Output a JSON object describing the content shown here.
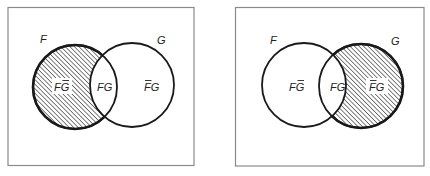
{
  "diagrams": [
    {
      "id": "left",
      "description": "Venn diagram with region F minus G (F and not G) shaded",
      "sets": {
        "F": {
          "label": "F"
        },
        "G": {
          "label": "G"
        }
      },
      "regions": {
        "f_only": {
          "label": "FG",
          "overbar": "G",
          "shaded": true
        },
        "both": {
          "label": "FG",
          "overbar": null,
          "shaded": false
        },
        "g_only": {
          "label": "FG",
          "overbar": "F",
          "shaded": false
        }
      }
    },
    {
      "id": "right",
      "description": "Venn diagram with region G minus F (not F and G) shaded",
      "sets": {
        "F": {
          "label": "F"
        },
        "G": {
          "label": "G"
        }
      },
      "regions": {
        "f_only": {
          "label": "FG",
          "overbar": "G",
          "shaded": false
        },
        "both": {
          "label": "FG",
          "overbar": null,
          "shaded": false
        },
        "g_only": {
          "label": "FG",
          "overbar": "F",
          "shaded": true
        }
      }
    }
  ],
  "style": {
    "outline_color": "#1a1a1a",
    "frame_color": "#8a8a8a",
    "hatch_color": "#2a2a2a",
    "background": "#ffffff"
  }
}
